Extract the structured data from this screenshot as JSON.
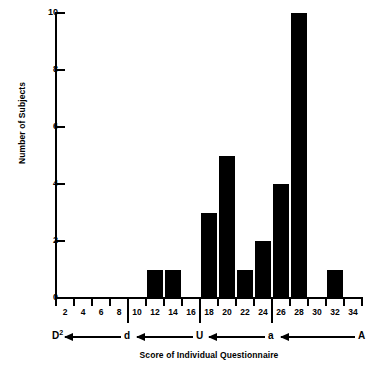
{
  "chart_data": {
    "type": "bar",
    "title": "",
    "subtitle": "",
    "xlabel": "Score of Individual Questionnaire",
    "ylabel": "Number of Subjects",
    "categories": [
      2,
      4,
      6,
      8,
      10,
      12,
      14,
      16,
      18,
      20,
      22,
      24,
      26,
      28,
      30,
      32,
      34
    ],
    "values": [
      0,
      0,
      0,
      0,
      0,
      1,
      1,
      0,
      3,
      5,
      1,
      2,
      4,
      10,
      0,
      1,
      0
    ],
    "x_tick_labels": [
      "2",
      "4",
      "6",
      "8",
      "10",
      "12",
      "14",
      "16",
      "18",
      "20",
      "22",
      "24",
      "26",
      "28",
      "30",
      "32",
      "34"
    ],
    "y_tick_labels": [
      "0",
      "2",
      "4",
      "6",
      "8",
      "10"
    ],
    "y_ticks": [
      0,
      2,
      4,
      6,
      8,
      10
    ],
    "xlim": [
      1,
      35
    ],
    "ylim": [
      0,
      10
    ],
    "grid": false,
    "legend": "none",
    "bar_color": "#000000",
    "axis_color": "#000000",
    "background_color": "#ffffff",
    "annotations": {
      "scale_name": "questionnaire-category-scale",
      "segments": [
        {
          "label": "D",
          "superscript": "2",
          "boundary_score": 1
        },
        {
          "label": "d",
          "boundary_score": 9
        },
        {
          "label": "U",
          "boundary_score": 17
        },
        {
          "label": "a",
          "boundary_score": 25
        },
        {
          "label": "A",
          "boundary_score": 35
        }
      ],
      "arrow_direction": "left"
    },
    "major_boundary_ticks": [
      9,
      17,
      25
    ]
  }
}
